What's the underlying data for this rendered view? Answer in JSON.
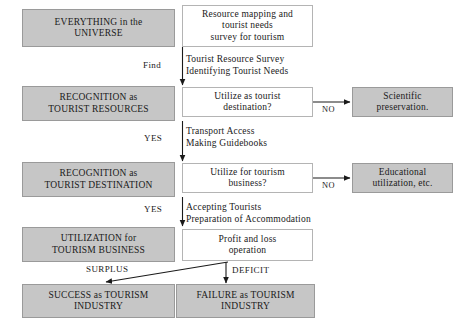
{
  "diagram": {
    "colors": {
      "box_fill_gray": "#c6c6c6",
      "box_fill_white": "#ffffff",
      "border": "#9a9a9a",
      "line": "#1a1a1a",
      "text": "#1a1a1a"
    },
    "stage_boxes": [
      {
        "id": "everything-universe",
        "line1": "EVERYTHING in the",
        "line2": "UNIVERSE"
      },
      {
        "id": "recognition-tourist-resources",
        "line1": "RECOGNITION as",
        "line2": "TOURIST RESOURCES"
      },
      {
        "id": "recognition-tourist-destination",
        "line1": "RECOGNITION as",
        "line2": "TOURIST DESTINATION"
      },
      {
        "id": "utilization-tourism-business",
        "line1": "UTILIZATION for",
        "line2": "TOURISM BUSINESS"
      },
      {
        "id": "success-tourism-industry",
        "line1": "SUCCESS as TOURISM",
        "line2": "INDUSTRY"
      },
      {
        "id": "failure-tourism-industry",
        "line1": "FAILURE as TOURISM",
        "line2": "INDUSTRY"
      }
    ],
    "action_boxes": [
      {
        "id": "resource-mapping",
        "line1": "Resource mapping and",
        "line2": "tourist needs",
        "line3": "survey for tourism"
      },
      {
        "id": "utilize-as-tourist-destination",
        "line1": "Utilize as tourist",
        "line2": "destination?"
      },
      {
        "id": "utilize-for-tourism-business",
        "line1": "Utilize for tourism",
        "line2": "business?"
      },
      {
        "id": "profit-and-loss",
        "line1": "Profit and loss",
        "line2": "operation"
      }
    ],
    "outcome_boxes": [
      {
        "id": "scientific-preservation",
        "line1": "Scientific",
        "line2": "preservation."
      },
      {
        "id": "educational-utilization",
        "line1": "Educational",
        "line2": "utilization, etc."
      }
    ],
    "notes": [
      {
        "id": "note-tourist-resource-survey",
        "text": "Tourist Resource Survey\nIdentifying Tourist Needs"
      },
      {
        "id": "note-transport-access",
        "text": "Transport Access\nMaking Guidebooks"
      },
      {
        "id": "note-accepting-tourists",
        "text": "Accepting Tourists\nPreparation of Accommodation"
      }
    ],
    "edge_labels": [
      {
        "id": "label-find",
        "text": "Find"
      },
      {
        "id": "label-yes-1",
        "text": "YES"
      },
      {
        "id": "label-yes-2",
        "text": "YES"
      },
      {
        "id": "label-no-1",
        "text": "NO"
      },
      {
        "id": "label-no-2",
        "text": "NO"
      },
      {
        "id": "label-surplus",
        "text": "SURPLUS"
      },
      {
        "id": "label-deficit",
        "text": "DEFICIT"
      }
    ]
  }
}
